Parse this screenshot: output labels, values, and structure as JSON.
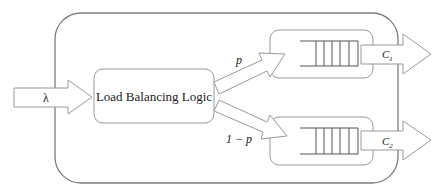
{
  "diagram": {
    "title": "",
    "input": {
      "label": "λ"
    },
    "load_balancer": {
      "label": "Load Balancing Logic"
    },
    "branches": [
      {
        "label": "p",
        "queue_slots": 5,
        "output_label": "C",
        "output_subscript": "1"
      },
      {
        "label": "1 − p",
        "queue_slots": 5,
        "output_label": "C",
        "output_subscript": "2"
      }
    ],
    "colors": {
      "stroke": "#9a9a9a",
      "outer_stroke": "#7d7d7d",
      "text": "#222222",
      "background": "#ffffff"
    }
  }
}
